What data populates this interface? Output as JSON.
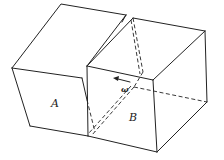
{
  "diagram": {
    "type": "3d-block-illustration",
    "labels": {
      "block_a": "A",
      "block_b": "B",
      "angular_velocity": "ω"
    },
    "colors": {
      "line": "#222222",
      "background": "#ffffff"
    }
  }
}
